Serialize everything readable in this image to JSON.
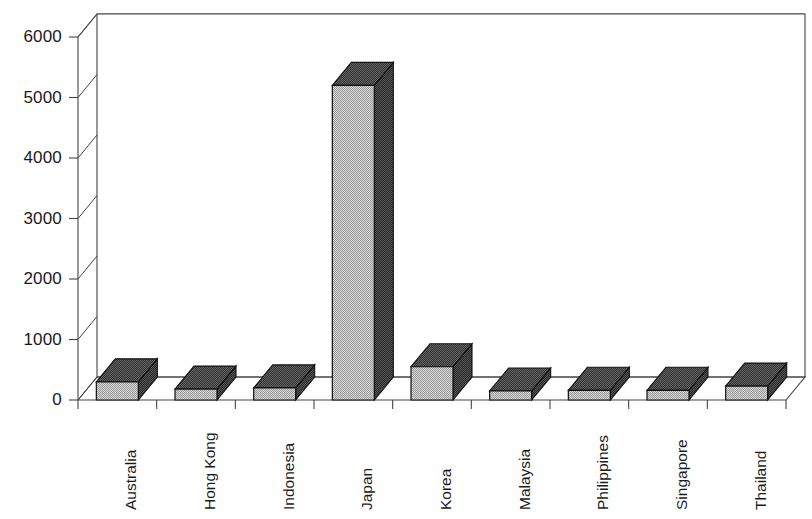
{
  "chart_data": {
    "type": "bar",
    "title": "",
    "subtitle": "",
    "xlabel": "",
    "ylabel": "",
    "style": "3d-column",
    "grid": "horizontal",
    "legend": "none",
    "ylim": [
      0,
      6000
    ],
    "ytick_step": 1000,
    "yticks": [
      "0",
      "1000",
      "2000",
      "3000",
      "4000",
      "5000",
      "6000"
    ],
    "categories": [
      "Australia",
      "Hong Kong",
      "Indonesia",
      "Japan",
      "Korea",
      "Malaysia",
      "Philippines",
      "Singapore",
      "Thailand"
    ],
    "values": [
      300,
      180,
      200,
      5200,
      550,
      150,
      160,
      160,
      230
    ],
    "colors": {
      "bar_front": "#c8c8c8",
      "bar_side": "#3a3a3a",
      "bar_top": "#4a4a4a",
      "outline": "#111111",
      "gridline": "#555555",
      "axis": "#444444",
      "background": "#ffffff",
      "text": "#1a1a1a"
    }
  }
}
